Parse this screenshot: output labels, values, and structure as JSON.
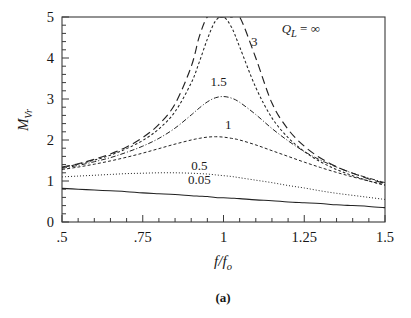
{
  "figure": {
    "caption": "(a)"
  },
  "chart_data": {
    "type": "line",
    "title": "",
    "xlabel": "f/f_o",
    "ylabel": "M_Vr",
    "xlim": [
      0.5,
      1.5
    ],
    "ylim": [
      0,
      5
    ],
    "grid": false,
    "legend_position": "inline-labels",
    "legend_title": "Q_L",
    "x_ticks": [
      0.5,
      0.75,
      1.0,
      1.25,
      1.5
    ],
    "x_tick_labels": [
      ".5",
      ".75",
      "1",
      "1.25",
      "1.5"
    ],
    "y_ticks": [
      0,
      1,
      2,
      3,
      4,
      5
    ],
    "y_tick_labels": [
      "0",
      "1",
      "2",
      "3",
      "4",
      "5"
    ],
    "y_minor_step": 0.2,
    "x_minor_step": 0.05,
    "x": [
      0.5,
      0.55,
      0.6,
      0.65,
      0.7,
      0.75,
      0.8,
      0.85,
      0.9,
      0.925,
      0.95,
      0.975,
      1.0,
      1.025,
      1.05,
      1.1,
      1.15,
      1.2,
      1.25,
      1.3,
      1.35,
      1.4,
      1.45,
      1.5
    ],
    "series": [
      {
        "name": "0.05",
        "label": "0.05",
        "q_value": 0.05,
        "style": "solid",
        "values": [
          0.82,
          0.8,
          0.78,
          0.76,
          0.74,
          0.71,
          0.69,
          0.67,
          0.64,
          0.63,
          0.62,
          0.6,
          0.59,
          0.58,
          0.57,
          0.54,
          0.52,
          0.49,
          0.47,
          0.45,
          0.42,
          0.4,
          0.38,
          0.35
        ],
        "label_xy": [
          0.92,
          0.92
        ]
      },
      {
        "name": "0.5",
        "label": "0.5",
        "q_value": 0.5,
        "style": "dotted",
        "values": [
          1.1,
          1.12,
          1.14,
          1.16,
          1.18,
          1.19,
          1.2,
          1.2,
          1.19,
          1.18,
          1.17,
          1.15,
          1.13,
          1.11,
          1.08,
          1.02,
          0.96,
          0.89,
          0.83,
          0.76,
          0.7,
          0.65,
          0.6,
          0.55
        ],
        "label_xy": [
          0.92,
          1.25
        ]
      },
      {
        "name": "1",
        "label": "1",
        "q_value": 1.0,
        "style": "short-dash",
        "values": [
          1.28,
          1.34,
          1.41,
          1.49,
          1.58,
          1.68,
          1.79,
          1.9,
          2.0,
          2.04,
          2.07,
          2.08,
          2.07,
          2.04,
          2.0,
          1.88,
          1.74,
          1.6,
          1.46,
          1.33,
          1.21,
          1.1,
          1.0,
          0.9
        ],
        "label_xy": [
          1.02,
          2.25
        ]
      },
      {
        "name": "1.5",
        "label": "1.5",
        "q_value": 1.5,
        "style": "dash-dot",
        "values": [
          1.31,
          1.38,
          1.47,
          1.57,
          1.7,
          1.85,
          2.04,
          2.29,
          2.61,
          2.78,
          2.93,
          3.03,
          3.06,
          3.02,
          2.92,
          2.62,
          2.28,
          1.98,
          1.72,
          1.51,
          1.34,
          1.19,
          1.07,
          0.96
        ],
        "label_xy": [
          1.0,
          3.3
        ]
      },
      {
        "name": "3",
        "label": "3",
        "q_value": 3.0,
        "style": "fine-dash",
        "values": [
          1.33,
          1.41,
          1.51,
          1.63,
          1.79,
          1.99,
          2.27,
          2.69,
          3.39,
          3.9,
          4.46,
          4.9,
          5.0,
          4.75,
          4.27,
          3.28,
          2.54,
          2.06,
          1.72,
          1.47,
          1.28,
          1.13,
          1.0,
          0.9
        ],
        "label_xy": [
          1.1,
          4.35
        ]
      },
      {
        "name": "inf",
        "label": "Q_L = ∞",
        "q_value": null,
        "style": "long-dash",
        "values": [
          1.34,
          1.42,
          1.53,
          1.66,
          1.83,
          2.06,
          2.38,
          2.88,
          3.79,
          4.52,
          5.0,
          5.0,
          5.0,
          5.0,
          5.0,
          4.0,
          2.9,
          2.26,
          1.85,
          1.56,
          1.35,
          1.19,
          1.05,
          0.94
        ],
        "label_xy": [
          1.18,
          4.6
        ]
      }
    ],
    "annotations": [
      {
        "text": "Q_L = ∞",
        "x": 1.18,
        "y": 4.6
      },
      {
        "text": "3",
        "x": 1.095,
        "y": 4.3
      },
      {
        "text": "1.5",
        "x": 0.985,
        "y": 3.32
      },
      {
        "text": "1",
        "x": 1.015,
        "y": 2.27
      },
      {
        "text": "0.5",
        "x": 0.925,
        "y": 1.27
      },
      {
        "text": "0.05",
        "x": 0.925,
        "y": 0.93
      }
    ]
  },
  "labels": {
    "y_axis_main": "M",
    "y_axis_sub": "Vr",
    "x_axis_num": "f",
    "x_axis_den": "f",
    "x_axis_den_sub": "o",
    "q_symbol": "Q",
    "q_sub": "L",
    "q_equals": " = ",
    "infinity": "∞"
  },
  "tick_values": {
    "x": [
      ".5",
      ".75",
      "1",
      "1.25",
      "1.5"
    ],
    "y": [
      "0",
      "1",
      "2",
      "3",
      "4",
      "5"
    ]
  }
}
